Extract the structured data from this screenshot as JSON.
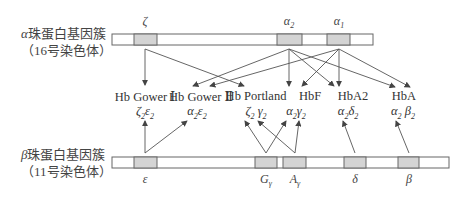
{
  "alpha_cluster": {
    "label_line1_greek": "α",
    "label_line1_text": "珠蛋白基因簇",
    "label_line2": "（16号染色体）",
    "genes": [
      {
        "name": "ζ",
        "sub": ""
      },
      {
        "name": "α",
        "sub": "2"
      },
      {
        "name": "α",
        "sub": "1"
      }
    ]
  },
  "beta_cluster": {
    "label_line1_greek": "β",
    "label_line1_text": "珠蛋白基因簇",
    "label_line2": "（11号染色体）",
    "genes": [
      {
        "name": "ε",
        "sub": ""
      },
      {
        "name": "G",
        "sub": "γ"
      },
      {
        "name": "A",
        "sub": "γ"
      },
      {
        "name": "δ",
        "sub": ""
      },
      {
        "name": "β",
        "sub": ""
      }
    ]
  },
  "hemoglobins": [
    {
      "name": "Hb Gower Ⅰ",
      "f1": "ζ",
      "s1": "2",
      "f2": "ε",
      "s2": "2"
    },
    {
      "name": "Hb Gower Ⅱ",
      "f1": "α",
      "s1": "2",
      "f2": "ε",
      "s2": "2"
    },
    {
      "name": "Hb Portland",
      "f1": "ζ",
      "s1": "2",
      "f2": "γ",
      "s2": "2"
    },
    {
      "name": "HbF",
      "f1": "α",
      "s1": "2",
      "f2": "γ",
      "s2": "2"
    },
    {
      "name": "HbA2",
      "f1": "α",
      "s1": "2",
      "f2": "δ",
      "s2": "2"
    },
    {
      "name": "HbA",
      "f1": "α",
      "s1": "2",
      "f2": "β",
      "s2": "2"
    }
  ],
  "colors": {
    "gene_box_fill": "#d4d4d4",
    "bar_fill": "#ffffff",
    "line": "#555555"
  }
}
